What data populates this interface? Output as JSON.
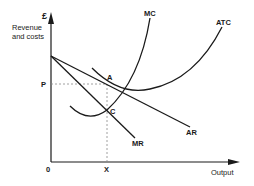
{
  "diagram": {
    "type": "economics-monopoly-cost-revenue",
    "y_axis": {
      "unit_symbol": "£",
      "label_line1": "Revenue",
      "label_line2": "and costs",
      "price_marker": "P"
    },
    "x_axis": {
      "label": "Output",
      "origin": "0",
      "quantity_marker": "X"
    },
    "curves": {
      "mc": "MC",
      "atc": "ATC",
      "ar": "AR",
      "mr": "MR"
    },
    "points": {
      "a": "A",
      "c": "C"
    },
    "colors": {
      "line": "#1a1a1a",
      "dashed": "#888888",
      "background": "#ffffff"
    }
  }
}
